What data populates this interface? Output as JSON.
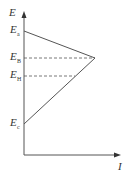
{
  "diagram": {
    "type": "energy-current triangle diagram",
    "axes": {
      "y_label": "E",
      "x_label": "I"
    },
    "levels": [
      {
        "id": "a",
        "main": "E",
        "sub": "a",
        "y": 31
      },
      {
        "id": "B",
        "main": "E",
        "sub": "B",
        "y": 58
      },
      {
        "id": "H",
        "main": "E",
        "sub": "H",
        "y": 76
      },
      {
        "id": "c",
        "main": "E",
        "sub": "c",
        "y": 124
      }
    ],
    "lines": {
      "upper_solid": {
        "from": "E_a",
        "to": "apex"
      },
      "lower_solid": {
        "from": "E_c",
        "to": "apex"
      },
      "dashed_B": {
        "from": "E_B",
        "to": "apex"
      },
      "dashed_H": {
        "from": "E_H",
        "to": "lower line"
      }
    },
    "colors": {
      "line": "#555555",
      "text": "#333333",
      "background": "#ffffff"
    }
  }
}
